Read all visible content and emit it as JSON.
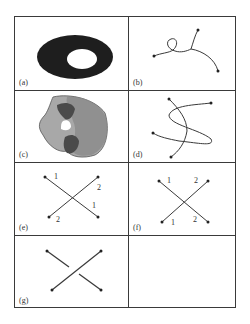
{
  "figure": {
    "panels": [
      {
        "id": "a",
        "label": "(a)",
        "content": "annulus-dark-ellipse-with-hole"
      },
      {
        "id": "b",
        "label": "(b)",
        "content": "single-curve-with-loop"
      },
      {
        "id": "c",
        "label": "(c)",
        "content": "overlapping-shaded-regions"
      },
      {
        "id": "d",
        "label": "(d)",
        "content": "two-crossing-curves"
      },
      {
        "id": "e",
        "label": "(e)",
        "content": "crossing-segments-labeled",
        "numbers": [
          "1",
          "2",
          "1",
          "2"
        ]
      },
      {
        "id": "f",
        "label": "(f)",
        "content": "crossing-segments-labeled",
        "numbers": [
          "1",
          "2",
          "1",
          "2"
        ]
      },
      {
        "id": "g",
        "label": "(g)",
        "content": "crossing-segments-over-under"
      },
      {
        "id": "h",
        "label": "",
        "content": "empty"
      }
    ],
    "colors": {
      "line": "#3a3a3a",
      "dark_fill": "#1e1e1e",
      "mid_gray": "#8a8a8a",
      "light_gray": "#a8a8a8",
      "dark_gray": "#4a4a4a"
    }
  }
}
